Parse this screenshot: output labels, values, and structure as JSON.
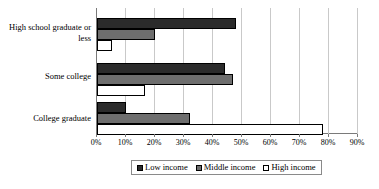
{
  "chart_data": {
    "type": "bar",
    "orientation": "horizontal",
    "title": "",
    "xlabel": "",
    "ylabel": "",
    "categories": [
      "High school graduate or less",
      "Some college",
      "College graduate"
    ],
    "series": [
      {
        "name": "Low income",
        "color": "#2b2b2b",
        "values": [
          48,
          44,
          10
        ]
      },
      {
        "name": "Middle income",
        "color": "#6e6e6e",
        "values": [
          20,
          47,
          32
        ]
      },
      {
        "name": "High income",
        "color": "#ffffff",
        "values": [
          5,
          16.5,
          78
        ]
      }
    ],
    "xlim": [
      0,
      90
    ],
    "xtick_labels": [
      "0%",
      "10%",
      "20%",
      "30%",
      "40%",
      "50%",
      "60%",
      "70%",
      "80%",
      "90%"
    ],
    "xtick_values": [
      0,
      10,
      20,
      30,
      40,
      50,
      60,
      70,
      80,
      90
    ],
    "grid": true,
    "grid_axis": "x",
    "legend_position": "bottom"
  },
  "axis": {
    "category_labels": [
      {
        "line1": "High school graduate or",
        "line2": "less"
      },
      {
        "line1": "Some college",
        "line2": ""
      },
      {
        "line1": "College graduate",
        "line2": ""
      }
    ]
  },
  "legend": {
    "items": [
      {
        "label": "Low income"
      },
      {
        "label": "Middle income"
      },
      {
        "label": "High income"
      }
    ]
  }
}
